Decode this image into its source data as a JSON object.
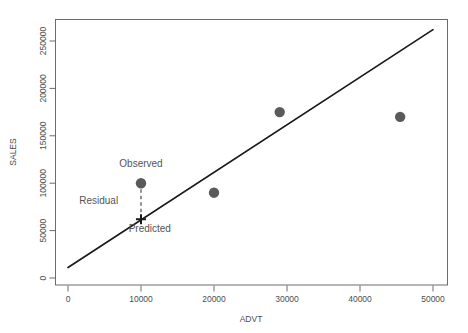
{
  "chart_data": {
    "type": "scatter",
    "title": "",
    "xlabel": "ADVT",
    "ylabel": "SALES",
    "xlim": [
      0,
      52000
    ],
    "ylim": [
      0,
      265000
    ],
    "xticks": [
      0,
      10000,
      20000,
      30000,
      40000,
      50000
    ],
    "xtick_labels": [
      "0",
      "10000",
      "20000",
      "30000",
      "40000",
      "50000"
    ],
    "yticks": [
      0,
      50000,
      100000,
      150000,
      200000,
      250000
    ],
    "ytick_labels": [
      "0",
      "50000",
      "100000",
      "150000",
      "200000",
      "250000"
    ],
    "grid": false,
    "legend": "none",
    "point_color": "#5a5a5a",
    "line_color": "#1a1a1a",
    "points": [
      {
        "x": 10000,
        "y": 100000,
        "label": "Observed"
      },
      {
        "x": 20000,
        "y": 90000,
        "label": ""
      },
      {
        "x": 29000,
        "y": 175000,
        "label": ""
      },
      {
        "x": 45500,
        "y": 170000,
        "label": ""
      }
    ],
    "fit_line": {
      "name": "regression-line",
      "x0": 0,
      "y0": 11000,
      "x1": 50000,
      "y1": 262000
    },
    "predicted_point": {
      "x": 10000,
      "y": 62000,
      "marker": "plus",
      "label": "Predicted"
    },
    "residual_segment": {
      "x": 10000,
      "y_top": 100000,
      "y_bottom": 62000,
      "label": "Residual",
      "style": "dashed"
    },
    "annotations": [
      {
        "name": "observed-label",
        "text": "Observed",
        "x": 10000,
        "y": 117000
      },
      {
        "name": "residual-label",
        "text": "Residual",
        "x": 4200,
        "y": 78000
      },
      {
        "name": "predicted-label",
        "text": "Predicted",
        "x": 11200,
        "y": 48000
      }
    ]
  }
}
